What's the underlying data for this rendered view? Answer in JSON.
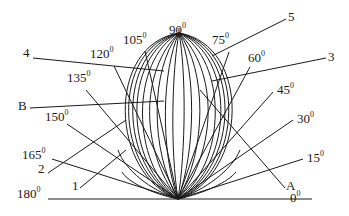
{
  "diagram": {
    "type": "radiation-pattern / polar dome of curves with angle labels",
    "line_color": "#1a1a1a",
    "origin": {
      "x": 178,
      "y": 199
    },
    "baseline": {
      "x1": 48,
      "x2": 312,
      "y": 199
    },
    "degree_symbol": "0",
    "angle_labels": [
      {
        "id": "a0",
        "value": "0",
        "x": 290,
        "y": 190
      },
      {
        "id": "a15",
        "value": "15",
        "x": 307,
        "y": 150
      },
      {
        "id": "a30",
        "value": "30",
        "x": 297,
        "y": 111
      },
      {
        "id": "a45",
        "value": "45",
        "x": 277,
        "y": 82
      },
      {
        "id": "a60",
        "value": "60",
        "x": 248,
        "y": 50
      },
      {
        "id": "a75",
        "value": "75",
        "x": 212,
        "y": 32
      },
      {
        "id": "a90",
        "value": "90",
        "x": 169,
        "y": 22
      },
      {
        "id": "a105",
        "value": "105",
        "x": 123,
        "y": 32
      },
      {
        "id": "a120",
        "value": "120",
        "x": 90,
        "y": 46
      },
      {
        "id": "a135",
        "value": "135",
        "x": 67,
        "y": 70
      },
      {
        "id": "a150",
        "value": "150",
        "x": 45,
        "y": 109
      },
      {
        "id": "a165",
        "value": "165",
        "x": 22,
        "y": 147
      },
      {
        "id": "a180",
        "value": "180",
        "x": 17,
        "y": 186
      }
    ],
    "callout_labels": [
      {
        "id": "c4",
        "text": "4",
        "x": 23,
        "y": 46
      },
      {
        "id": "c5",
        "text": "5",
        "x": 288,
        "y": 10
      },
      {
        "id": "c3",
        "text": "3",
        "x": 328,
        "y": 50
      },
      {
        "id": "cB",
        "text": "B",
        "x": 18,
        "y": 99
      },
      {
        "id": "c2",
        "text": "2",
        "x": 38,
        "y": 162
      },
      {
        "id": "c1",
        "text": "1",
        "x": 72,
        "y": 179
      },
      {
        "id": "cA",
        "text": "A",
        "x": 286,
        "y": 179
      }
    ]
  }
}
